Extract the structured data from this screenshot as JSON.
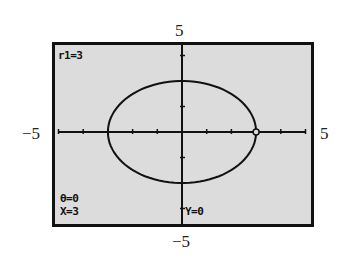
{
  "window_labels": {
    "ymax": "5",
    "ymin": "−5",
    "xmin": "−5",
    "xmax": "5"
  },
  "screen": {
    "equation": "r1=3",
    "theta": "θ=0",
    "x_value": "X=3",
    "y_value": "Y=0"
  },
  "colors": {
    "screen_bg": "#dcdcdc",
    "ink": "#111111"
  },
  "chart_data": {
    "type": "line",
    "title": "",
    "plot_mode": "polar",
    "xlabel": "",
    "ylabel": "",
    "xlim": [
      -5,
      5
    ],
    "ylim": [
      -5,
      5
    ],
    "x_tick_spacing": 1,
    "y_tick_spacing": 1,
    "grid": false,
    "tick_labels": {
      "left": "−5",
      "right": "5",
      "top": "5",
      "bottom": "−5"
    },
    "series": [
      {
        "name": "r1",
        "shape": "ellipse",
        "center": [
          0,
          0
        ],
        "semi_axis_x": 3,
        "semi_axis_y": 2
      }
    ],
    "trace_cursor": {
      "theta": 0,
      "x": 3,
      "y": 0,
      "r": 3
    },
    "annotations": [
      "r1=3",
      "θ=0",
      "X=3",
      "Y=0"
    ]
  }
}
